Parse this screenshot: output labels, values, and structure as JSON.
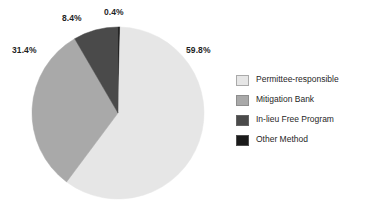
{
  "chart_data": {
    "type": "pie",
    "title": "",
    "subtitle": "",
    "xlabel": "",
    "ylabel": "",
    "grid": false,
    "legend_position": "right",
    "start_angle_deg": 0,
    "direction": "clockwise",
    "categories": [
      "Other Method",
      "Permittee-responsible",
      "Mitigation Bank",
      "In-lieu Free Program"
    ],
    "values": [
      0.4,
      59.8,
      31.4,
      8.4
    ],
    "value_unit": "%",
    "slices": [
      {
        "name": "Other Method",
        "value": 0.4,
        "data_label": "0.4%",
        "color": "#1a1a1a",
        "label_position": "top"
      },
      {
        "name": "Permittee-responsible",
        "value": 59.8,
        "data_label": "59.8%",
        "color": "#e6e6e6",
        "label_position": "right"
      },
      {
        "name": "Mitigation Bank",
        "value": 31.4,
        "data_label": "31.4%",
        "color": "#a9a9a9",
        "label_position": "left"
      },
      {
        "name": "In-lieu Free Program",
        "value": 8.4,
        "data_label": "8.4%",
        "color": "#4a4a4a",
        "label_position": "upper-left"
      }
    ]
  },
  "labels": {
    "pct_permittee": "59.8%",
    "pct_bank": "31.4%",
    "pct_inlieu": "8.4%",
    "pct_other": "0.4%"
  },
  "legend": {
    "items": [
      {
        "label": "Permittee-responsible",
        "color": "#e6e6e6"
      },
      {
        "label": "Mitigation Bank",
        "color": "#a9a9a9"
      },
      {
        "label": "In-lieu Free Program",
        "color": "#4a4a4a"
      },
      {
        "label": "Other Method",
        "color": "#1a1a1a"
      }
    ]
  },
  "colors": {
    "background": "#ffffff",
    "text": "#1f1f1f",
    "permittee": "#e6e6e6",
    "bank": "#a9a9a9",
    "inlieu": "#4a4a4a",
    "other": "#1a1a1a"
  },
  "geometry": {
    "center_x": 118,
    "center_y": 113,
    "radius": 86
  }
}
